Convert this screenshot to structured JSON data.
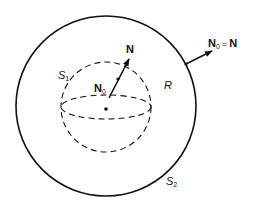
{
  "diagram": {
    "outer_surface": {
      "label": "S",
      "subscript": "2"
    },
    "inner_surface": {
      "label": "S",
      "subscript": "1"
    },
    "region": {
      "label": "R"
    },
    "inner_normal": {
      "base_label": "N",
      "base_subscript": "0",
      "tip_label": "N"
    },
    "outer_normal": {
      "label": "N",
      "subscript": "0",
      "equals": "=",
      "rhs": "N"
    },
    "colors": {
      "stroke": "#111111",
      "background": "#ffffff"
    }
  }
}
